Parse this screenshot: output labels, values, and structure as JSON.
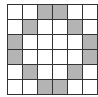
{
  "diagram": {
    "type": "grid",
    "rows": 6,
    "cols": 6,
    "colors": {
      "line": "#333333",
      "empty": "#ffffff",
      "shaded": "#b4b4b4"
    },
    "cells": [
      [
        0,
        0,
        1,
        1,
        0,
        0
      ],
      [
        0,
        1,
        0,
        0,
        1,
        0
      ],
      [
        1,
        0,
        0,
        0,
        0,
        1
      ],
      [
        1,
        0,
        0,
        0,
        0,
        1
      ],
      [
        0,
        1,
        0,
        0,
        1,
        0
      ],
      [
        0,
        0,
        1,
        1,
        0,
        0
      ]
    ]
  }
}
